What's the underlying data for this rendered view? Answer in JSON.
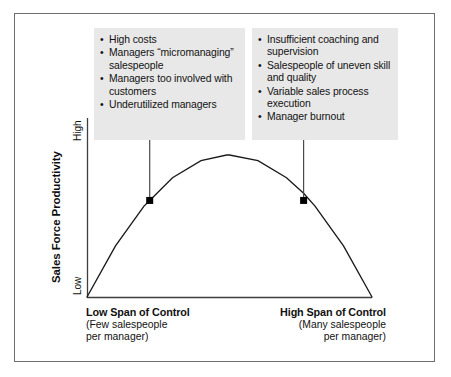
{
  "figure": {
    "callouts": [
      {
        "id": "low-span-issues",
        "items": [
          "High costs",
          "Managers “micromanaging” salespeople",
          "Managers too involved with customers",
          "Underutilized managers"
        ]
      },
      {
        "id": "high-span-issues",
        "items": [
          "Insufficient coaching and supervision",
          "Salespeople of uneven skill and quality",
          "Variable sales process execution",
          "Manager burnout"
        ]
      }
    ],
    "bullet_glyph": "•",
    "y_axis": {
      "title": "Sales Force Productivity",
      "tick_high": "High",
      "tick_low": "Low"
    },
    "x_axis": {
      "left": {
        "title": "Low Span of Control",
        "sub_line_1": "(Few salespeople",
        "sub_line_2": "per manager)"
      },
      "right": {
        "title": "High Span of Control",
        "sub_line_1": "(Many salespeople",
        "sub_line_2": "per manager)"
      }
    },
    "colors": {
      "frame": "#6e6e6e",
      "callout_bg": "#e8e8e8",
      "curve": "#1a1a1a",
      "marker": "#000000",
      "leader_line": "#555555",
      "text": "#111111"
    }
  },
  "chart_data": {
    "type": "line",
    "title": "",
    "xlabel": "Span of Control",
    "ylabel": "Sales Force Productivity",
    "xlim": [
      0,
      1
    ],
    "ylim": [
      0,
      1
    ],
    "grid": false,
    "legend": "none",
    "xtick_labels": [
      "Low Span of Control",
      "High Span of Control"
    ],
    "ytick_labels": [
      "Low",
      "High"
    ],
    "series": [
      {
        "name": "Sales force productivity vs. span of control",
        "shape": "inverted-parabola",
        "x": [
          0.0,
          0.1,
          0.2,
          0.22,
          0.3,
          0.4,
          0.49,
          0.5,
          0.6,
          0.7,
          0.76,
          0.8,
          0.9,
          1.0
        ],
        "y": [
          0.0,
          0.36,
          0.64,
          0.68,
          0.84,
          0.96,
          1.0,
          1.0,
          0.96,
          0.84,
          0.73,
          0.64,
          0.36,
          0.0
        ]
      }
    ],
    "annotations": [
      {
        "label": "low-span-marker",
        "x": 0.22,
        "y": 0.68,
        "marker": "square",
        "points_to": "low-span-issues"
      },
      {
        "label": "high-span-marker",
        "x": 0.76,
        "y": 0.68,
        "marker": "square",
        "points_to": "high-span-issues"
      }
    ]
  }
}
